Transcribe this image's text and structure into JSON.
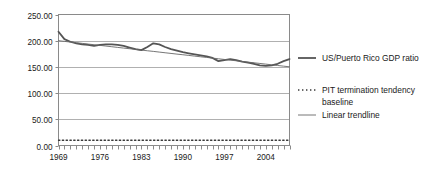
{
  "chart_data": {
    "type": "line",
    "title": "",
    "xlabel": "",
    "ylabel": "",
    "xlim": [
      1969,
      2008
    ],
    "ylim": [
      0,
      250
    ],
    "grid": true,
    "legend_position": "right",
    "y_ticks": [
      "0.00",
      "50.00",
      "100.00",
      "150.00",
      "200.00",
      "250.00"
    ],
    "y_tick_values": [
      0,
      50,
      100,
      150,
      200,
      250
    ],
    "x_ticks": [
      "1969",
      "1976",
      "1983",
      "1990",
      "1997",
      "2004"
    ],
    "x_tick_values": [
      1969,
      1976,
      1983,
      1990,
      1997,
      2004
    ],
    "x_minor_tick_step": 1,
    "x": [
      1969,
      1970,
      1971,
      1972,
      1973,
      1974,
      1975,
      1976,
      1977,
      1978,
      1979,
      1980,
      1981,
      1982,
      1983,
      1984,
      1985,
      1986,
      1987,
      1988,
      1989,
      1990,
      1991,
      1992,
      1993,
      1994,
      1995,
      1996,
      1997,
      1998,
      1999,
      2000,
      2001,
      2002,
      2003,
      2004,
      2005,
      2006,
      2007,
      2008
    ],
    "series": [
      {
        "name": "US/Puerto Rico GDP ratio",
        "style": "solid-thick",
        "color": "#555555",
        "width": 1.8,
        "values": [
          217,
          203,
          198,
          195,
          193,
          192,
          190,
          192,
          193,
          193,
          192,
          190,
          187,
          184,
          182,
          188,
          195,
          193,
          188,
          184,
          181,
          178,
          176,
          174,
          172,
          170,
          167,
          161,
          163,
          165,
          163,
          160,
          158,
          156,
          153,
          152,
          153,
          156,
          161,
          165
        ]
      },
      {
        "name": "PIT termination tendency baseline",
        "style": "dotted",
        "color": "#3a3a3a",
        "width": 1.3,
        "constant": 10,
        "values": [
          10,
          10,
          10,
          10,
          10,
          10,
          10,
          10,
          10,
          10,
          10,
          10,
          10,
          10,
          10,
          10,
          10,
          10,
          10,
          10,
          10,
          10,
          10,
          10,
          10,
          10,
          10,
          10,
          10,
          10,
          10,
          10,
          10,
          10,
          10,
          10,
          10,
          10,
          10,
          10
        ]
      },
      {
        "name": "Linear trendline",
        "style": "solid-thin",
        "color": "#666666",
        "width": 0.9,
        "values": [
          200.0,
          198.7,
          197.4,
          196.2,
          194.9,
          193.6,
          192.3,
          191.1,
          189.8,
          188.5,
          187.2,
          185.9,
          184.7,
          183.4,
          182.1,
          180.8,
          179.6,
          178.3,
          177.0,
          175.7,
          174.4,
          173.2,
          171.9,
          170.6,
          169.3,
          168.1,
          166.8,
          165.5,
          164.2,
          162.9,
          161.7,
          160.4,
          159.1,
          157.8,
          156.6,
          155.3,
          154.0,
          152.7,
          151.4,
          150.2
        ]
      }
    ]
  },
  "legend": {
    "items": [
      {
        "label": "US/Puerto Rico GDP ratio",
        "style": "solid-thick"
      },
      {
        "label": "PIT termination tendency",
        "label2": "baseline",
        "style": "dotted"
      },
      {
        "label": "Linear trendline",
        "style": "solid-thin"
      }
    ]
  },
  "colors": {
    "series_primary": "#555555",
    "baseline": "#3a3a3a",
    "trendline": "#666666",
    "gridline": "#b0b0b0",
    "axis": "#8a8a8a",
    "text": "#1a1a1a",
    "background": "#ffffff"
  }
}
